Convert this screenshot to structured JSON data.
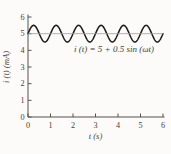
{
  "figure": {
    "background_color": "#fcfbf9",
    "axis_color": "#55534e",
    "text_color": "#45433e"
  },
  "chart_data": {
    "type": "line",
    "title": "",
    "xlabel": "t (s)",
    "ylabel": "i (t) (mA)",
    "annotation": "i (t) = 5 + 0.5 sin (ωt)",
    "xlim": [
      0,
      6
    ],
    "ylim": [
      0,
      6
    ],
    "x_ticks": [
      0,
      1,
      2,
      3,
      4,
      5,
      6
    ],
    "y_ticks": [
      0,
      1,
      2,
      3,
      4,
      5,
      6
    ],
    "grid": false,
    "legend": "none",
    "series": [
      {
        "name": "current-waveform",
        "kind": "function",
        "expression": "i(t) = 5 + 0.5*sin(2*PI*t)",
        "offset": 5,
        "amplitude": 0.5,
        "period_s": 1,
        "phase": 0,
        "x_range": [
          0,
          6
        ],
        "color": "#1c1b19",
        "width": 1.5
      },
      {
        "name": "mean-level-line",
        "kind": "hline",
        "y": 5,
        "color": "#a09e98",
        "width": 0.8
      }
    ]
  }
}
